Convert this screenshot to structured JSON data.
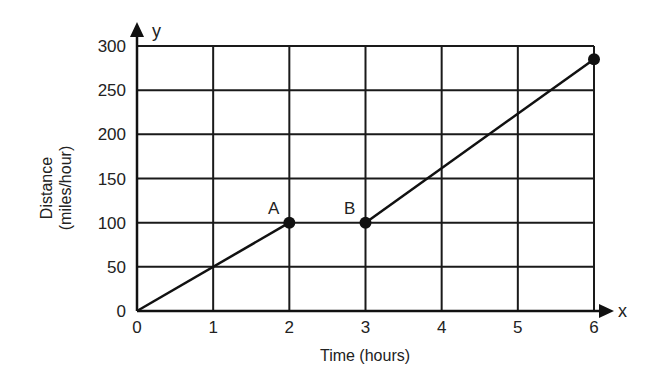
{
  "chart_data": {
    "type": "line",
    "title": "",
    "xlabel": "Time (hours)",
    "ylabel_lines": [
      "Distance",
      "(miles/hour)"
    ],
    "x_axis_letter": "x",
    "y_axis_letter": "y",
    "x_ticks": [
      "0",
      "1",
      "2",
      "3",
      "4",
      "5",
      "6"
    ],
    "y_ticks": [
      "0",
      "50",
      "100",
      "150",
      "200",
      "250",
      "300"
    ],
    "xlim": [
      0,
      6
    ],
    "ylim": [
      0,
      300
    ],
    "grid": true,
    "legend": null,
    "series": [
      {
        "name": "segment-1",
        "points": [
          {
            "x": 0,
            "y": 0
          },
          {
            "x": 2,
            "y": 100
          }
        ]
      },
      {
        "name": "segment-2",
        "points": [
          {
            "x": 3,
            "y": 100
          },
          {
            "x": 6,
            "y": 285
          }
        ]
      }
    ],
    "annotations": [
      {
        "label": "A",
        "x": 2,
        "y": 100
      },
      {
        "label": "B",
        "x": 3,
        "y": 100
      }
    ],
    "markers": [
      {
        "x": 2,
        "y": 100
      },
      {
        "x": 3,
        "y": 100
      },
      {
        "x": 6,
        "y": 285
      }
    ]
  },
  "labels": {
    "xlabel": "Time (hours)",
    "ylabel_line1": "Distance",
    "ylabel_line2": "(miles/hour)",
    "x_letter": "x",
    "y_letter": "y",
    "point_a": "A",
    "point_b": "B",
    "x_ticks": [
      "0",
      "1",
      "2",
      "3",
      "4",
      "5",
      "6"
    ],
    "y_ticks": [
      "0",
      "50",
      "100",
      "150",
      "200",
      "250",
      "300"
    ]
  }
}
